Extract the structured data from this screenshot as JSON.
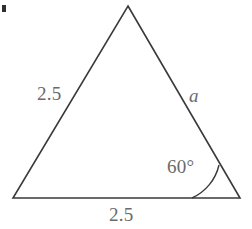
{
  "figure": {
    "type": "geometry-diagram",
    "shape": "triangle",
    "background_color": "#ffffff",
    "stroke_color": "#3a3a3a",
    "label_color": "#6a6a6a",
    "vertices": {
      "apex": {
        "x": 128,
        "y": 6
      },
      "bottom_left": {
        "x": 13,
        "y": 198
      },
      "bottom_right": {
        "x": 240,
        "y": 198
      }
    },
    "angle_arc": {
      "vertex": {
        "x": 240,
        "y": 198
      },
      "radius": 48,
      "start": {
        "x": 192,
        "y": 198
      },
      "end": {
        "x": 219,
        "y": 165
      }
    },
    "labels": {
      "side_left": "2.5",
      "side_right": "a",
      "angle": "60°",
      "base": "2.5"
    },
    "corner_mark": "bullet-artifact"
  }
}
